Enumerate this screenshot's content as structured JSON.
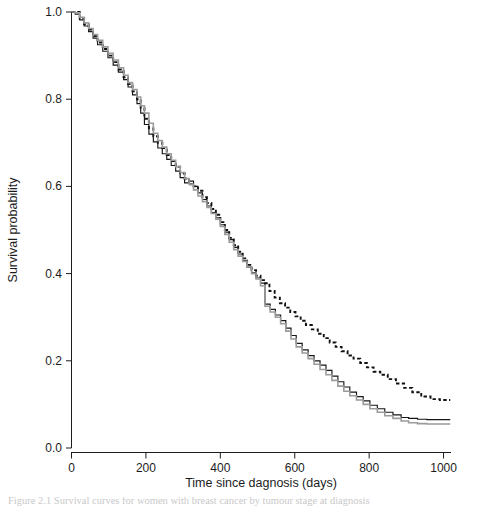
{
  "figure": {
    "caption_partial": "Figure 2.1 Survival curves for women with breast cancer by tumour stage at diagnosis"
  },
  "chart_data": {
    "type": "line",
    "title": "",
    "xlabel": "Time since dagnosis (days)",
    "ylabel": "Survival probability",
    "xlim": [
      0,
      1020
    ],
    "ylim": [
      0.0,
      1.0
    ],
    "grid": false,
    "legend": "none",
    "xticks": [
      0,
      200,
      400,
      600,
      800,
      1000
    ],
    "xtick_labels": [
      "0",
      "200",
      "400",
      "600",
      "800",
      "1000"
    ],
    "yticks": [
      0.0,
      0.2,
      0.4,
      0.6,
      0.8,
      1.0
    ],
    "ytick_labels": [
      "0.0",
      "0.2",
      "0.4",
      "0.6",
      "0.8",
      "1.0"
    ],
    "step_type": "post",
    "series": [
      {
        "name": "dashed-curve",
        "style": "dashed",
        "color": "#111111",
        "width": 1.9,
        "x": [
          0,
          10,
          22,
          34,
          46,
          58,
          70,
          84,
          98,
          112,
          126,
          140,
          152,
          164,
          176,
          186,
          196,
          208,
          220,
          232,
          244,
          256,
          268,
          280,
          292,
          304,
          316,
          328,
          340,
          352,
          364,
          376,
          388,
          400,
          412,
          424,
          436,
          448,
          460,
          472,
          484,
          496,
          508,
          520,
          532,
          546,
          560,
          574,
          588,
          602,
          616,
          630,
          646,
          662,
          678,
          694,
          710,
          726,
          742,
          758,
          776,
          794,
          812,
          830,
          850,
          872,
          894,
          916,
          940,
          965,
          990,
          1018
        ],
        "y": [
          1.0,
          1.0,
          0.985,
          0.972,
          0.96,
          0.945,
          0.93,
          0.915,
          0.9,
          0.885,
          0.868,
          0.85,
          0.835,
          0.818,
          0.8,
          0.78,
          0.755,
          0.733,
          0.715,
          0.7,
          0.688,
          0.672,
          0.658,
          0.645,
          0.63,
          0.618,
          0.605,
          0.6,
          0.59,
          0.575,
          0.562,
          0.548,
          0.535,
          0.518,
          0.5,
          0.482,
          0.465,
          0.45,
          0.435,
          0.42,
          0.408,
          0.395,
          0.385,
          0.378,
          0.36,
          0.345,
          0.332,
          0.322,
          0.312,
          0.302,
          0.292,
          0.282,
          0.272,
          0.262,
          0.252,
          0.242,
          0.232,
          0.222,
          0.212,
          0.205,
          0.195,
          0.185,
          0.175,
          0.168,
          0.158,
          0.148,
          0.138,
          0.128,
          0.118,
          0.112,
          0.11,
          0.11
        ]
      },
      {
        "name": "solid-black-curve",
        "style": "solid",
        "color": "#161616",
        "width": 1.15,
        "x": [
          0,
          10,
          22,
          34,
          46,
          58,
          70,
          84,
          98,
          112,
          126,
          140,
          152,
          164,
          176,
          186,
          196,
          208,
          220,
          232,
          244,
          256,
          268,
          280,
          292,
          304,
          316,
          328,
          340,
          352,
          364,
          376,
          388,
          400,
          412,
          424,
          436,
          448,
          460,
          472,
          484,
          496,
          508,
          520,
          534,
          548,
          562,
          576,
          590,
          604,
          620,
          636,
          652,
          668,
          684,
          700,
          716,
          732,
          748,
          766,
          784,
          802,
          822,
          842,
          864,
          886,
          906,
          930,
          955,
          980,
          1018
        ],
        "y": [
          1.0,
          0.995,
          0.982,
          0.968,
          0.955,
          0.94,
          0.925,
          0.91,
          0.895,
          0.878,
          0.862,
          0.845,
          0.828,
          0.81,
          0.79,
          0.768,
          0.742,
          0.72,
          0.702,
          0.688,
          0.675,
          0.662,
          0.648,
          0.635,
          0.62,
          0.608,
          0.612,
          0.6,
          0.585,
          0.57,
          0.555,
          0.54,
          0.528,
          0.512,
          0.495,
          0.478,
          0.46,
          0.445,
          0.43,
          0.415,
          0.402,
          0.39,
          0.378,
          0.33,
          0.318,
          0.305,
          0.292,
          0.275,
          0.258,
          0.24,
          0.225,
          0.212,
          0.2,
          0.19,
          0.178,
          0.165,
          0.152,
          0.14,
          0.128,
          0.118,
          0.108,
          0.098,
          0.09,
          0.082,
          0.076,
          0.07,
          0.068,
          0.066,
          0.065,
          0.065,
          0.065
        ]
      },
      {
        "name": "gray-curve",
        "style": "solid",
        "color": "#9b9b9b",
        "width": 1.6,
        "x": [
          0,
          10,
          22,
          34,
          46,
          58,
          70,
          84,
          98,
          112,
          126,
          140,
          152,
          164,
          176,
          186,
          196,
          208,
          220,
          232,
          244,
          256,
          268,
          280,
          292,
          304,
          316,
          328,
          340,
          352,
          364,
          376,
          388,
          400,
          412,
          424,
          436,
          448,
          460,
          472,
          484,
          496,
          508,
          520,
          534,
          548,
          562,
          576,
          590,
          604,
          620,
          636,
          652,
          668,
          684,
          700,
          716,
          732,
          748,
          766,
          784,
          802,
          822,
          842,
          864,
          886,
          906,
          930,
          955,
          980,
          1018
        ],
        "y": [
          1.0,
          0.998,
          0.988,
          0.975,
          0.962,
          0.948,
          0.935,
          0.92,
          0.905,
          0.89,
          0.872,
          0.855,
          0.838,
          0.822,
          0.805,
          0.785,
          0.768,
          0.745,
          0.722,
          0.705,
          0.69,
          0.675,
          0.66,
          0.645,
          0.632,
          0.618,
          0.605,
          0.592,
          0.578,
          0.565,
          0.552,
          0.538,
          0.525,
          0.508,
          0.49,
          0.472,
          0.455,
          0.44,
          0.428,
          0.415,
          0.4,
          0.388,
          0.372,
          0.325,
          0.312,
          0.3,
          0.285,
          0.268,
          0.25,
          0.232,
          0.218,
          0.205,
          0.192,
          0.18,
          0.168,
          0.155,
          0.142,
          0.13,
          0.12,
          0.11,
          0.1,
          0.09,
          0.082,
          0.074,
          0.068,
          0.062,
          0.058,
          0.056,
          0.055,
          0.055,
          0.055
        ]
      }
    ]
  }
}
